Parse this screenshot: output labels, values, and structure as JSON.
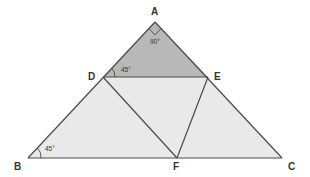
{
  "diagram": {
    "type": "geometry-triangle",
    "vertices": {
      "A": {
        "label": "A",
        "x": 155,
        "y": 22
      },
      "B": {
        "label": "B",
        "x": 28,
        "y": 158
      },
      "C": {
        "label": "C",
        "x": 282,
        "y": 158
      },
      "D": {
        "label": "D",
        "x": 103,
        "y": 77
      },
      "E": {
        "label": "E",
        "x": 208,
        "y": 77
      },
      "F": {
        "label": "F",
        "x": 177,
        "y": 158
      }
    },
    "segments": [
      "AB",
      "AC",
      "BC",
      "DE",
      "DF",
      "EF"
    ],
    "shaded_region": {
      "name": "ADE",
      "fill": "#b8b8b8"
    },
    "light_region_fill": "#e9e9e9",
    "stroke_color": "#4a4a4a",
    "angles": {
      "A": "90°",
      "D": "45°",
      "B": "45°"
    }
  }
}
